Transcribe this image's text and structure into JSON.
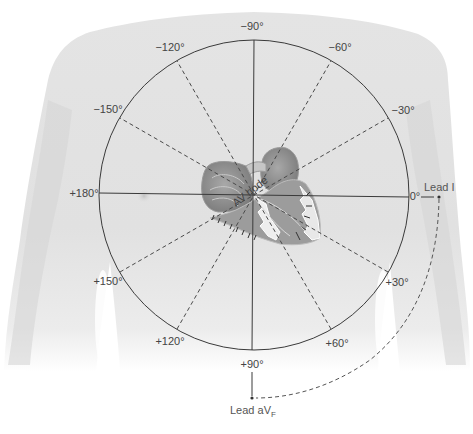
{
  "diagram": {
    "type": "hexaxial-reference-system",
    "center": [
      254,
      195
    ],
    "radius": 155,
    "colors": {
      "skin_light": "#ebebeb",
      "skin_mid": "#dcdcdc",
      "skin_shadow": "#cfcfcf",
      "circle_line": "#3a3a3a",
      "dashed_line": "#4a4a4a",
      "label": "#444444",
      "heart_dark": "#8a8a8a",
      "heart_mid": "#b0b0b0",
      "heart_light": "#e6e6e6"
    },
    "solid_axes": [
      {
        "name": "horizontal-axis",
        "angle": 0
      },
      {
        "name": "vertical-axis",
        "angle": 90
      }
    ],
    "dashed_axes": [
      {
        "name": "axis-30-210",
        "angle": 30
      },
      {
        "name": "axis-60-240",
        "angle": 60
      },
      {
        "name": "axis-120-300",
        "angle": 120
      },
      {
        "name": "axis-150-330",
        "angle": 150
      }
    ],
    "angle_labels": [
      {
        "id": "deg-minus90",
        "text": "−90°",
        "x": 252,
        "y": 30
      },
      {
        "id": "deg-minus60",
        "text": "−60°",
        "x": 340,
        "y": 51
      },
      {
        "id": "deg-minus30",
        "text": "−30°",
        "x": 403,
        "y": 114
      },
      {
        "id": "deg-0",
        "text": "0°",
        "x": 415,
        "y": 200
      },
      {
        "id": "deg-plus30",
        "text": "+30°",
        "x": 397,
        "y": 286
      },
      {
        "id": "deg-plus60",
        "text": "+60°",
        "x": 337,
        "y": 347
      },
      {
        "id": "deg-plus90",
        "text": "+90°",
        "x": 252,
        "y": 368
      },
      {
        "id": "deg-plus120",
        "text": "+120°",
        "x": 170,
        "y": 345
      },
      {
        "id": "deg-plus150",
        "text": "+150°",
        "x": 108,
        "y": 285
      },
      {
        "id": "deg-plus180",
        "text": "+180°",
        "x": 98,
        "y": 197
      },
      {
        "id": "deg-minus150",
        "text": "−150°",
        "x": 108,
        "y": 113
      },
      {
        "id": "deg-minus120",
        "text": "−120°",
        "x": 167,
        "y": 51
      }
    ],
    "annotations": {
      "av_node": "AV node",
      "lead_i": "Lead I",
      "lead_avf_main": "Lead aV",
      "lead_avf_sub": "F"
    },
    "leads": {
      "lead_i_dot": [
        439,
        197
      ],
      "lead_avf_dot": [
        252,
        398
      ]
    }
  }
}
